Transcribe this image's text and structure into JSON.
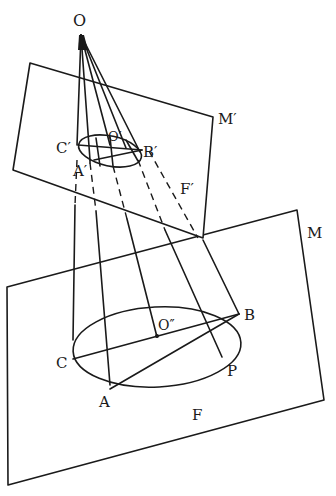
{
  "diagram": {
    "type": "central-projection-of-circle",
    "labels": {
      "apex": "O",
      "upper_plane": "M′",
      "upper_figure": "F′",
      "upper_center": "O′",
      "upper_point_a": "A′",
      "upper_point_b": "B′",
      "upper_point_c": "C′",
      "lower_plane": "M",
      "lower_figure": "F",
      "lower_center": "O″",
      "lower_point_a": "A",
      "lower_point_b": "B",
      "lower_point_c": "C",
      "lower_point_p": "P"
    },
    "colors": {
      "line": "#1a1a1a",
      "background": "#ffffff"
    }
  }
}
